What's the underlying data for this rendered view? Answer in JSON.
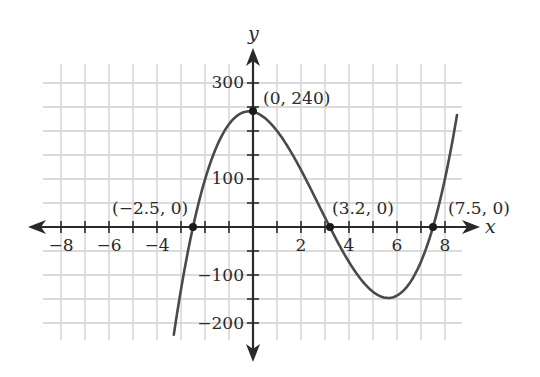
{
  "chart_data": {
    "type": "line",
    "title": "",
    "xlabel": "x",
    "ylabel": "y",
    "xlim": [
      -8.75,
      8.75
    ],
    "ylim": [
      -250,
      340
    ],
    "grid": true,
    "grid_x_step": 1,
    "grid_y_step": 50,
    "x_ticks": [
      -8,
      -6,
      -4,
      2,
      4,
      6,
      8
    ],
    "x_tick_labels": [
      "−8",
      "−6",
      "−4",
      "2",
      "4",
      "6",
      "8"
    ],
    "y_ticks": [
      300,
      100,
      -100,
      -200
    ],
    "y_tick_labels": [
      "300",
      "100",
      "−100",
      "−200"
    ],
    "series": [
      {
        "name": "cubic",
        "formula": "y = 4(x + 2.5)(x − 3.2)(x − 7.5)",
        "x_range": [
          -3.3,
          8.5
        ],
        "x": [
          -3.3,
          -3.0,
          -2.5,
          -2.0,
          -1.0,
          0,
          1.0,
          2.0,
          3.0,
          3.2,
          4.0,
          5.0,
          5.6,
          6.0,
          7.0,
          7.5,
          8.0,
          8.5
        ],
        "y": [
          -233,
          -156,
          0,
          118,
          243,
          240,
          146,
          0,
          -100,
          0,
          -128,
          -148,
          -148,
          -143,
          -82,
          0,
          92,
          233
        ],
        "color": "#4a4a4a"
      }
    ],
    "annotations": [
      {
        "label": "(0, 240)",
        "x": 0,
        "y": 240
      },
      {
        "label": "(−2.5, 0)",
        "x": -2.5,
        "y": 0
      },
      {
        "label": "(3.2, 0)",
        "x": 3.2,
        "y": 0
      },
      {
        "label": "(7.5, 0)",
        "x": 7.5,
        "y": 0
      }
    ]
  },
  "labels": {
    "x_axis": "x",
    "y_axis": "y",
    "points": {
      "y_intercept": "(0, 240)",
      "root_left": "(−2.5, 0)",
      "root_mid": "(3.2, 0)",
      "root_right": "(7.5, 0)"
    },
    "x_ticks": [
      "−8",
      "−6",
      "−4",
      "2",
      "4",
      "6",
      "8"
    ],
    "y_ticks": [
      "300",
      "100",
      "−100",
      "−200"
    ]
  },
  "colors": {
    "grid": "#cfcfcf",
    "axis": "#2a2a2a",
    "curve": "#4a4a4a",
    "point": "#1a1a1a"
  }
}
